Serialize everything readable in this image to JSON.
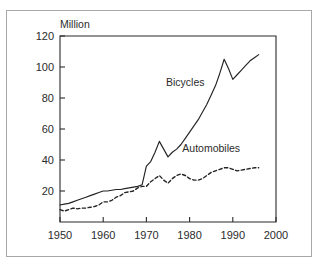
{
  "figure": {
    "background_color": "#ffffff",
    "frame_color": "#a8a8a8",
    "ink_color": "#232323"
  },
  "axis_unit": {
    "label": "Million"
  },
  "labels": {
    "bicycles": "Bicycles",
    "automobiles": "Automobiles"
  },
  "chart_data": {
    "type": "line",
    "title": "",
    "subtitle": "",
    "xlabel": "",
    "ylabel": "Million",
    "xlim": [
      1950,
      2000
    ],
    "ylim": [
      0,
      120
    ],
    "xticks": [
      1950,
      1960,
      1970,
      1980,
      1990,
      2000
    ],
    "xticklabels": [
      "1950",
      "1960",
      "1970",
      "1980",
      "1990",
      "2000"
    ],
    "yticks": [
      20,
      40,
      60,
      80,
      100,
      120
    ],
    "yticklabels": [
      "20",
      "40",
      "60",
      "80",
      "100",
      "120"
    ],
    "grid": false,
    "legend_position": "inline-annotation",
    "annotations": [
      {
        "text": "Bicycles",
        "x": 1979,
        "y": 88
      },
      {
        "text": "Automobiles",
        "x": 1985,
        "y": 45
      }
    ],
    "series": [
      {
        "name": "Bicycles",
        "style": "solid",
        "color": "#232323",
        "x": [
          1950,
          1951,
          1952,
          1953,
          1954,
          1955,
          1956,
          1957,
          1958,
          1959,
          1960,
          1961,
          1962,
          1963,
          1964,
          1965,
          1966,
          1967,
          1968,
          1969,
          1970,
          1971,
          1972,
          1973,
          1974,
          1975,
          1976,
          1977,
          1978,
          1979,
          1980,
          1981,
          1982,
          1983,
          1984,
          1985,
          1986,
          1987,
          1988,
          1989,
          1990,
          1991,
          1992,
          1993,
          1994,
          1995,
          1996
        ],
        "values": [
          11,
          11.5,
          12,
          13,
          14,
          15,
          16,
          17,
          18,
          19,
          20,
          20,
          20.5,
          21,
          21,
          21.5,
          22,
          22.5,
          23,
          24,
          36,
          39,
          45,
          52,
          47,
          42,
          45,
          47,
          50,
          54,
          58,
          62,
          66,
          71,
          76,
          82,
          88,
          96,
          105,
          99,
          92,
          95,
          98,
          101,
          104,
          106,
          108
        ]
      },
      {
        "name": "Automobiles",
        "style": "dashed",
        "color": "#232323",
        "x": [
          1950,
          1951,
          1952,
          1953,
          1954,
          1955,
          1956,
          1957,
          1958,
          1959,
          1960,
          1961,
          1962,
          1963,
          1964,
          1965,
          1966,
          1967,
          1968,
          1969,
          1970,
          1971,
          1972,
          1973,
          1974,
          1975,
          1976,
          1977,
          1978,
          1979,
          1980,
          1981,
          1982,
          1983,
          1984,
          1985,
          1986,
          1987,
          1988,
          1989,
          1990,
          1991,
          1992,
          1993,
          1994,
          1995,
          1996
        ],
        "values": [
          8,
          7,
          8,
          9,
          8.5,
          9,
          9,
          9.5,
          10,
          11,
          13,
          13,
          14,
          16,
          17,
          19,
          19.5,
          20,
          22,
          23,
          23,
          26,
          28,
          30,
          27,
          25,
          28,
          30,
          31,
          30,
          28,
          27,
          27,
          28,
          30,
          32,
          33,
          34,
          35,
          35,
          34,
          33,
          33.5,
          34,
          34.5,
          35,
          35
        ]
      }
    ]
  }
}
